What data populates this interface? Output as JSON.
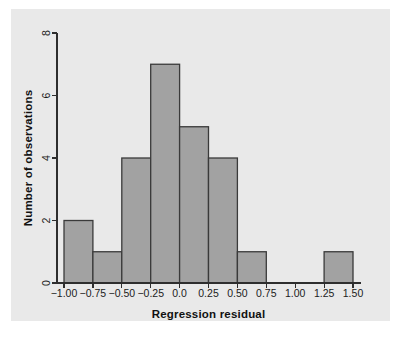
{
  "figure": {
    "background_color": "#ffffff",
    "panel_color": "#e9e9e9",
    "bar_fill_color": "#a2a2a2",
    "bar_edge_color": "#3a3a3a",
    "axis_color": "#2e2e2e"
  },
  "chart_data": {
    "type": "bar",
    "title": "",
    "xlabel": "Regression residual",
    "ylabel": "Number of observations",
    "xlim": [
      -1.0,
      1.5
    ],
    "ylim": [
      0,
      8
    ],
    "grid": false,
    "legend": null,
    "bin_width": 0.25,
    "x_tick_labels": [
      "−1.00",
      "−0.75",
      "−0.50",
      "−0.25",
      "0.0",
      "0.25",
      "0.50",
      "0.75",
      "1.00",
      "1.25",
      "1.50"
    ],
    "x_tick_values": [
      -1.0,
      -0.75,
      -0.5,
      -0.25,
      0.0,
      0.25,
      0.5,
      0.75,
      1.0,
      1.25,
      1.5
    ],
    "y_tick_labels": [
      "0",
      "2",
      "4",
      "6",
      "8"
    ],
    "y_tick_values": [
      0,
      2,
      4,
      6,
      8
    ],
    "categories": [
      "-1.00 to -0.75",
      "-0.75 to -0.50",
      "-0.50 to -0.25",
      "-0.25 to 0.00",
      "0.00 to 0.25",
      "0.25 to 0.50",
      "0.50 to 0.75",
      "0.75 to 1.00",
      "1.00 to 1.25",
      "1.25 to 1.50"
    ],
    "bin_edges": [
      -1.0,
      -0.75,
      -0.5,
      -0.25,
      0.0,
      0.25,
      0.5,
      0.75,
      1.0,
      1.25,
      1.5
    ],
    "values": [
      2,
      1,
      4,
      7,
      5,
      4,
      1,
      0,
      0,
      1
    ],
    "total_observations": 25
  }
}
